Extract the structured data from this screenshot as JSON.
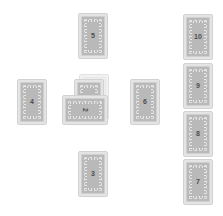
{
  "spread": {
    "name": "Celtic Cross Tarot Spread",
    "card_back_style": "ornate-gray",
    "colors": {
      "background": "#ffffff",
      "card_border": "#d2d2d2",
      "card_face": "#e4e4e4",
      "card_back": "#b9b9b9",
      "number_text": "#4e4e4e",
      "ghost_card": "#f1f1f1"
    }
  },
  "cards": [
    {
      "id": "card-1",
      "number": "1",
      "position": "center-significator",
      "x": 74,
      "y": 79,
      "rotation": 0,
      "z": 3,
      "style": "normal"
    },
    {
      "id": "card-2",
      "number": "2",
      "position": "crossing",
      "x": 70,
      "y": 87,
      "rotation": 90,
      "z": 4,
      "style": "crossed"
    },
    {
      "id": "card-3",
      "number": "3",
      "position": "below",
      "x": 78,
      "y": 151,
      "rotation": 0,
      "z": 1,
      "style": "normal"
    },
    {
      "id": "card-4",
      "number": "4",
      "position": "left",
      "x": 17,
      "y": 79,
      "rotation": 0,
      "z": 1,
      "style": "normal"
    },
    {
      "id": "card-5",
      "number": "5",
      "position": "above",
      "x": 78,
      "y": 13,
      "rotation": 0,
      "z": 1,
      "style": "normal"
    },
    {
      "id": "card-6",
      "number": "6",
      "position": "right",
      "x": 130,
      "y": 79,
      "rotation": 0,
      "z": 1,
      "style": "normal"
    },
    {
      "id": "card-7",
      "number": "7",
      "position": "staff-1",
      "x": 183,
      "y": 159,
      "rotation": 0,
      "z": 1,
      "style": "normal"
    },
    {
      "id": "card-8",
      "number": "8",
      "position": "staff-2",
      "x": 183,
      "y": 111,
      "rotation": 0,
      "z": 1,
      "style": "normal"
    },
    {
      "id": "card-9",
      "number": "9",
      "position": "staff-3",
      "x": 183,
      "y": 63,
      "rotation": 0,
      "z": 1,
      "style": "normal"
    },
    {
      "id": "card-10",
      "number": "10",
      "position": "staff-4",
      "x": 183,
      "y": 14,
      "rotation": 0,
      "z": 1,
      "style": "normal"
    },
    {
      "id": "card-deck-ghost",
      "number": "",
      "position": "center-behind",
      "x": 79,
      "y": 74,
      "rotation": 0,
      "z": 2,
      "style": "ghost"
    }
  ]
}
